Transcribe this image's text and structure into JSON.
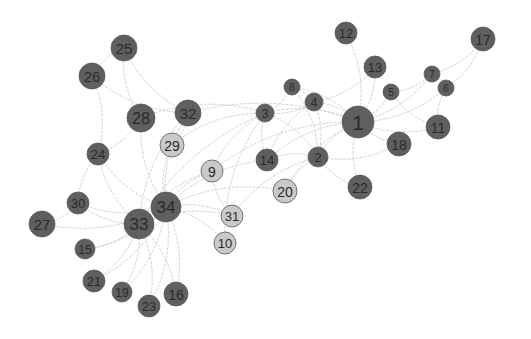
{
  "graph": {
    "title": "Network graph (Zachary karate club)",
    "colors": {
      "dark": "#5f5f5f",
      "light": "#c9c9c9",
      "edge": "#c8c8c8",
      "label": "#2a2a2a",
      "background": "#ffffff"
    },
    "nodes": [
      {
        "id": "1",
        "x": 358,
        "y": 122,
        "r": 16,
        "group": "dark"
      },
      {
        "id": "2",
        "x": 318,
        "y": 157,
        "r": 10,
        "group": "dark"
      },
      {
        "id": "3",
        "x": 265,
        "y": 113,
        "r": 9,
        "group": "dark"
      },
      {
        "id": "4",
        "x": 314,
        "y": 102,
        "r": 9,
        "group": "dark"
      },
      {
        "id": "5",
        "x": 391,
        "y": 92,
        "r": 8,
        "group": "dark"
      },
      {
        "id": "6",
        "x": 446,
        "y": 88,
        "r": 8,
        "group": "dark"
      },
      {
        "id": "7",
        "x": 432,
        "y": 74,
        "r": 8,
        "group": "dark"
      },
      {
        "id": "8",
        "x": 292,
        "y": 87,
        "r": 8,
        "group": "dark"
      },
      {
        "id": "9",
        "x": 212,
        "y": 171,
        "r": 11,
        "group": "light"
      },
      {
        "id": "10",
        "x": 225,
        "y": 243,
        "r": 11,
        "group": "light"
      },
      {
        "id": "11",
        "x": 438,
        "y": 127,
        "r": 12,
        "group": "dark"
      },
      {
        "id": "12",
        "x": 346,
        "y": 33,
        "r": 11,
        "group": "dark"
      },
      {
        "id": "13",
        "x": 375,
        "y": 67,
        "r": 11,
        "group": "dark"
      },
      {
        "id": "14",
        "x": 267,
        "y": 160,
        "r": 11,
        "group": "dark"
      },
      {
        "id": "15",
        "x": 85,
        "y": 249,
        "r": 10,
        "group": "dark"
      },
      {
        "id": "16",
        "x": 176,
        "y": 294,
        "r": 12,
        "group": "dark"
      },
      {
        "id": "17",
        "x": 483,
        "y": 39,
        "r": 12,
        "group": "dark"
      },
      {
        "id": "18",
        "x": 399,
        "y": 144,
        "r": 12,
        "group": "dark"
      },
      {
        "id": "19",
        "x": 122,
        "y": 292,
        "r": 10,
        "group": "dark"
      },
      {
        "id": "20",
        "x": 285,
        "y": 191,
        "r": 12,
        "group": "light"
      },
      {
        "id": "21",
        "x": 94,
        "y": 281,
        "r": 11,
        "group": "dark"
      },
      {
        "id": "22",
        "x": 360,
        "y": 187,
        "r": 12,
        "group": "dark"
      },
      {
        "id": "23",
        "x": 149,
        "y": 306,
        "r": 11,
        "group": "dark"
      },
      {
        "id": "24",
        "x": 98,
        "y": 154,
        "r": 11,
        "group": "dark"
      },
      {
        "id": "25",
        "x": 124,
        "y": 48,
        "r": 13,
        "group": "dark"
      },
      {
        "id": "26",
        "x": 92,
        "y": 76,
        "r": 13,
        "group": "dark"
      },
      {
        "id": "27",
        "x": 42,
        "y": 224,
        "r": 13,
        "group": "dark"
      },
      {
        "id": "28",
        "x": 141,
        "y": 118,
        "r": 14,
        "group": "dark"
      },
      {
        "id": "29",
        "x": 172,
        "y": 145,
        "r": 12,
        "group": "light"
      },
      {
        "id": "30",
        "x": 78,
        "y": 203,
        "r": 11,
        "group": "dark"
      },
      {
        "id": "31",
        "x": 232,
        "y": 216,
        "r": 11,
        "group": "light"
      },
      {
        "id": "32",
        "x": 188,
        "y": 113,
        "r": 13,
        "group": "dark"
      },
      {
        "id": "33",
        "x": 139,
        "y": 224,
        "r": 15,
        "group": "dark"
      },
      {
        "id": "34",
        "x": 166,
        "y": 207,
        "r": 15,
        "group": "dark"
      }
    ],
    "edges": [
      [
        "1",
        "2"
      ],
      [
        "1",
        "3"
      ],
      [
        "1",
        "4"
      ],
      [
        "1",
        "5"
      ],
      [
        "1",
        "6"
      ],
      [
        "1",
        "7"
      ],
      [
        "1",
        "8"
      ],
      [
        "1",
        "9"
      ],
      [
        "1",
        "11"
      ],
      [
        "1",
        "12"
      ],
      [
        "1",
        "13"
      ],
      [
        "1",
        "14"
      ],
      [
        "1",
        "18"
      ],
      [
        "1",
        "20"
      ],
      [
        "1",
        "22"
      ],
      [
        "1",
        "32"
      ],
      [
        "2",
        "3"
      ],
      [
        "2",
        "4"
      ],
      [
        "2",
        "8"
      ],
      [
        "2",
        "14"
      ],
      [
        "2",
        "18"
      ],
      [
        "2",
        "20"
      ],
      [
        "2",
        "22"
      ],
      [
        "2",
        "31"
      ],
      [
        "3",
        "4"
      ],
      [
        "3",
        "8"
      ],
      [
        "3",
        "9"
      ],
      [
        "3",
        "10"
      ],
      [
        "3",
        "14"
      ],
      [
        "3",
        "28"
      ],
      [
        "3",
        "29"
      ],
      [
        "3",
        "33"
      ],
      [
        "4",
        "8"
      ],
      [
        "4",
        "13"
      ],
      [
        "4",
        "14"
      ],
      [
        "5",
        "7"
      ],
      [
        "5",
        "11"
      ],
      [
        "6",
        "7"
      ],
      [
        "6",
        "11"
      ],
      [
        "6",
        "17"
      ],
      [
        "7",
        "17"
      ],
      [
        "9",
        "31"
      ],
      [
        "9",
        "33"
      ],
      [
        "9",
        "34"
      ],
      [
        "10",
        "34"
      ],
      [
        "14",
        "34"
      ],
      [
        "15",
        "33"
      ],
      [
        "15",
        "34"
      ],
      [
        "16",
        "33"
      ],
      [
        "16",
        "34"
      ],
      [
        "19",
        "33"
      ],
      [
        "19",
        "34"
      ],
      [
        "20",
        "34"
      ],
      [
        "21",
        "33"
      ],
      [
        "21",
        "34"
      ],
      [
        "23",
        "33"
      ],
      [
        "23",
        "34"
      ],
      [
        "24",
        "26"
      ],
      [
        "24",
        "28"
      ],
      [
        "24",
        "30"
      ],
      [
        "24",
        "33"
      ],
      [
        "24",
        "34"
      ],
      [
        "25",
        "26"
      ],
      [
        "25",
        "28"
      ],
      [
        "25",
        "32"
      ],
      [
        "26",
        "32"
      ],
      [
        "27",
        "30"
      ],
      [
        "27",
        "34"
      ],
      [
        "28",
        "34"
      ],
      [
        "29",
        "32"
      ],
      [
        "29",
        "34"
      ],
      [
        "30",
        "33"
      ],
      [
        "30",
        "34"
      ],
      [
        "31",
        "33"
      ],
      [
        "31",
        "34"
      ],
      [
        "32",
        "33"
      ],
      [
        "32",
        "34"
      ],
      [
        "33",
        "34"
      ]
    ]
  }
}
